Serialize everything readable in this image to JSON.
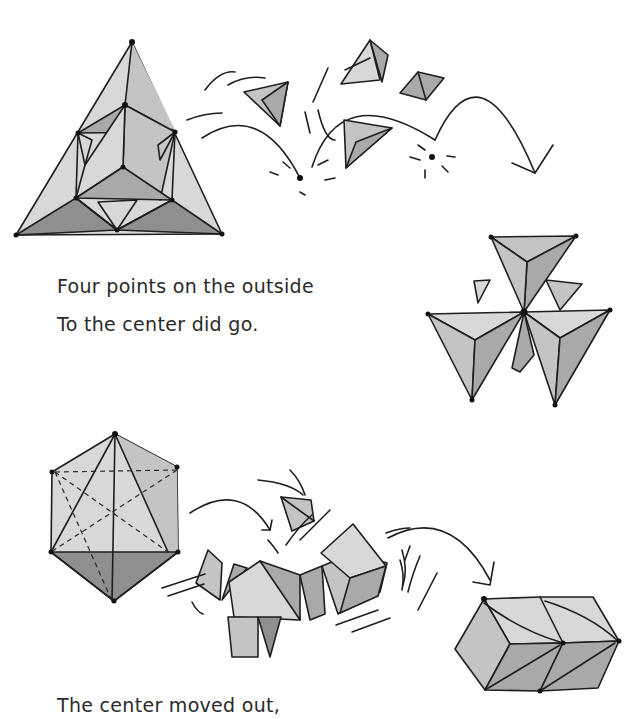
{
  "page": {
    "verses": [
      {
        "id": "verse-1-line-1",
        "text": "Four points on the outside"
      },
      {
        "id": "verse-1-line-2",
        "text": "To the center did go."
      },
      {
        "id": "verse-2-line-1",
        "text": "The center moved out,"
      }
    ],
    "illustrations": [
      {
        "name": "star-tetrahedron-triangle",
        "description": "Large triangle subdivided into tetrahedra"
      },
      {
        "name": "flying-tetrahedra",
        "description": "Four small tetrahedra bouncing with motion arcs"
      },
      {
        "name": "stellated-tetrahedra-cluster",
        "description": "Four tetrahedra meeting at a central point"
      },
      {
        "name": "octahedron-in-hexagon",
        "description": "Octahedron with dashed hidden edges"
      },
      {
        "name": "moving-pieces",
        "description": "Tetrahedra and octahedron pieces moving outward"
      },
      {
        "name": "double-rhombic-block",
        "description": "Two joined rhombohedra"
      }
    ],
    "colors": {
      "ink": "#1e1e1e",
      "shade_light": "#d8d8d8",
      "shade_mid": "#c4c4c4",
      "shade_dark": "#a9a9a9",
      "shade_darkest": "#8f8f8f"
    }
  }
}
